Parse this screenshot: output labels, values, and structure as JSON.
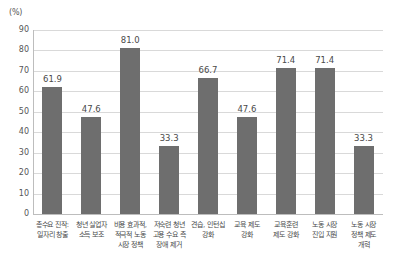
{
  "chart_data": {
    "type": "bar",
    "title": "",
    "subtitle": "",
    "unit_label": "(%)",
    "xlabel": "",
    "ylabel": "",
    "ylim": [
      0,
      90
    ],
    "ytick_step": 10,
    "grid": true,
    "legend": false,
    "bar_color": "#6e6e6e",
    "gridline_color": "#d9d9d9",
    "axis_color": "#bdbdbd",
    "yticks": [
      "90",
      "80",
      "70",
      "60",
      "50",
      "40",
      "30",
      "20",
      "10",
      "0"
    ],
    "categories": [
      "총수요 진작:\n일자리 창출",
      "청년 실업자\n소득 보조",
      "비용 효과적,\n적극적 노동\n시장 정책",
      "저숙련 청년\n고용 수요 측\n장애 제거",
      "견습, 인턴십\n강화",
      "교육 제도\n강화",
      "교육훈련\n제도 강화",
      "노동 시장\n진입 지원",
      "노동 시장\n정책 제도\n개혁"
    ],
    "values": [
      61.9,
      47.6,
      81.0,
      33.3,
      66.7,
      47.6,
      71.4,
      71.4,
      33.3
    ],
    "value_labels": [
      "61.9",
      "47.6",
      "81.0",
      "33.3",
      "66.7",
      "47.6",
      "71.4",
      "71.4",
      "33.3"
    ]
  }
}
